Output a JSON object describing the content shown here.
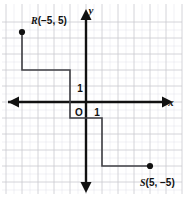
{
  "figure": {
    "kind": "coordinate-plane-staircase",
    "width": 184,
    "height": 198,
    "background_color": "#ffffff"
  },
  "axes": {
    "x_label": "x",
    "y_label": "y",
    "origin_label": "O",
    "x_unit_tick_label": "1",
    "y_unit_tick_label": "1",
    "axis_color": "#111111",
    "grid_color": "#c9c9cf",
    "grid_minor_color": "#e2e2e8",
    "grid_spacing_px": 16,
    "origin_px": {
      "x": 86,
      "y": 102
    },
    "x_range": [
      -5.5,
      6.0
    ],
    "y_range": [
      -6.0,
      4.5
    ]
  },
  "points": [
    {
      "id": "R",
      "name": "R",
      "coords": {
        "x": -5,
        "y": 5
      },
      "label_text": "(−5, 5)",
      "label_full": "R(−5, 5)",
      "px": {
        "x": 22,
        "y": 32
      },
      "marker_color": "#111111"
    },
    {
      "id": "S",
      "name": "S",
      "coords": {
        "x": 5,
        "y": -5
      },
      "label_text": "(5, −5)",
      "label_full": "S(5, −5)",
      "px": {
        "x": 150,
        "y": 166
      },
      "marker_color": "#111111"
    }
  ],
  "path": {
    "name": "staircase-path",
    "stroke_color": "#3f3f44",
    "stroke_width": 1.6,
    "vertices_px": [
      {
        "x": 22,
        "y": 32
      },
      {
        "x": 22,
        "y": 70
      },
      {
        "x": 70,
        "y": 70
      },
      {
        "x": 70,
        "y": 118
      },
      {
        "x": 102,
        "y": 118
      },
      {
        "x": 102,
        "y": 166
      },
      {
        "x": 150,
        "y": 166
      }
    ],
    "vertices_graph": [
      {
        "x": -4,
        "y": 4.4
      },
      {
        "x": -4,
        "y": 2
      },
      {
        "x": -1,
        "y": 2
      },
      {
        "x": -1,
        "y": -1
      },
      {
        "x": 1,
        "y": -1
      },
      {
        "x": 1,
        "y": -4
      },
      {
        "x": 4,
        "y": -4
      }
    ]
  },
  "grid": {
    "vertical_lines_px": [
      6,
      22,
      38,
      54,
      70,
      86,
      102,
      118,
      134,
      150,
      166,
      182
    ],
    "horizontal_lines_px": [
      22,
      38,
      54,
      70,
      86,
      102,
      118,
      134,
      150,
      166,
      182
    ]
  }
}
